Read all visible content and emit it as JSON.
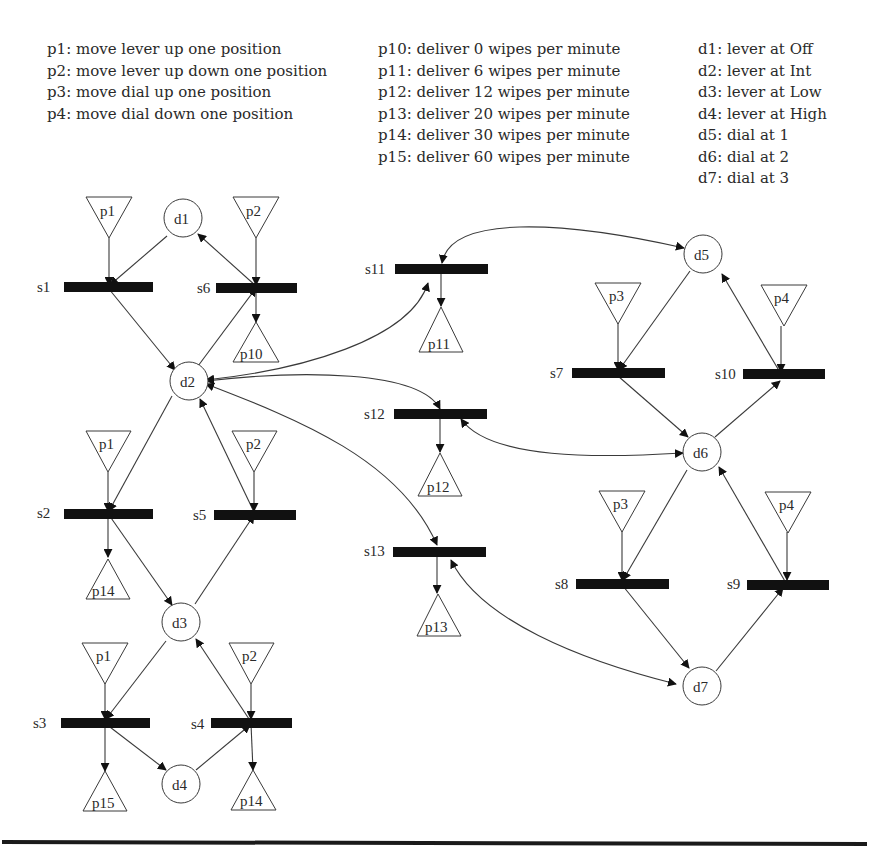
{
  "legend": {
    "actions": [
      "p1: move lever up one position",
      "p2: move lever up down one position",
      "p3: move dial up one position",
      "p4: move dial down one position"
    ],
    "outputs": [
      "p10: deliver 0 wipes per minute",
      "p11: deliver 6 wipes per minute",
      "p12: deliver 12 wipes per minute",
      "p13: deliver 20 wipes per minute",
      "p14: deliver 30 wipes per minute",
      "p15: deliver 60 wipes per minute"
    ],
    "states": [
      "d1: lever at Off",
      "d2: lever at Int",
      "d3: lever at Low",
      "d4: lever at High",
      "d5: dial at 1",
      "d6: dial at 2",
      "d7: dial at 3"
    ]
  },
  "nodes": {
    "d1": "d1",
    "d2": "d2",
    "d3": "d3",
    "d4": "d4",
    "d5": "d5",
    "d6": "d6",
    "d7": "d7"
  },
  "transitions": {
    "s1": "s1",
    "s2": "s2",
    "s3": "s3",
    "s4": "s4",
    "s5": "s5",
    "s6": "s6",
    "s7": "s7",
    "s8": "s8",
    "s9": "s9",
    "s10": "s10",
    "s11": "s11",
    "s12": "s12",
    "s13": "s13"
  },
  "places": {
    "in_s1": "p1",
    "in_s6": "p2",
    "in_s2": "p1",
    "in_s5": "p2",
    "in_s3": "p1",
    "in_s4": "p2",
    "in_s7": "p3",
    "in_s10": "p4",
    "in_s8": "p3",
    "in_s9": "p4",
    "out_s6": "p10",
    "out_s2": "p14",
    "out_s3": "p15",
    "out_s4": "p14",
    "out_s11": "p11",
    "out_s12": "p12",
    "out_s13": "p13"
  },
  "colors": {
    "bar": "#111111",
    "line": "#3a3a3a",
    "text": "#2a2a2a",
    "background": "#ffffff"
  }
}
